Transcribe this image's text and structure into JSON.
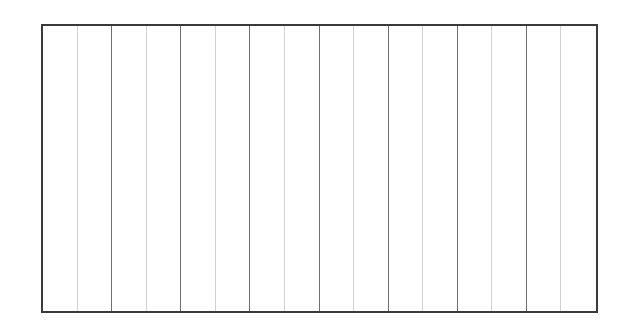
{
  "grid": {
    "columns": 16,
    "major_every": 2,
    "colors": {
      "border": "#3a3a3a",
      "major_line": "#6e6e6e",
      "minor_line": "#d2d2d2",
      "background": "#ffffff"
    }
  }
}
